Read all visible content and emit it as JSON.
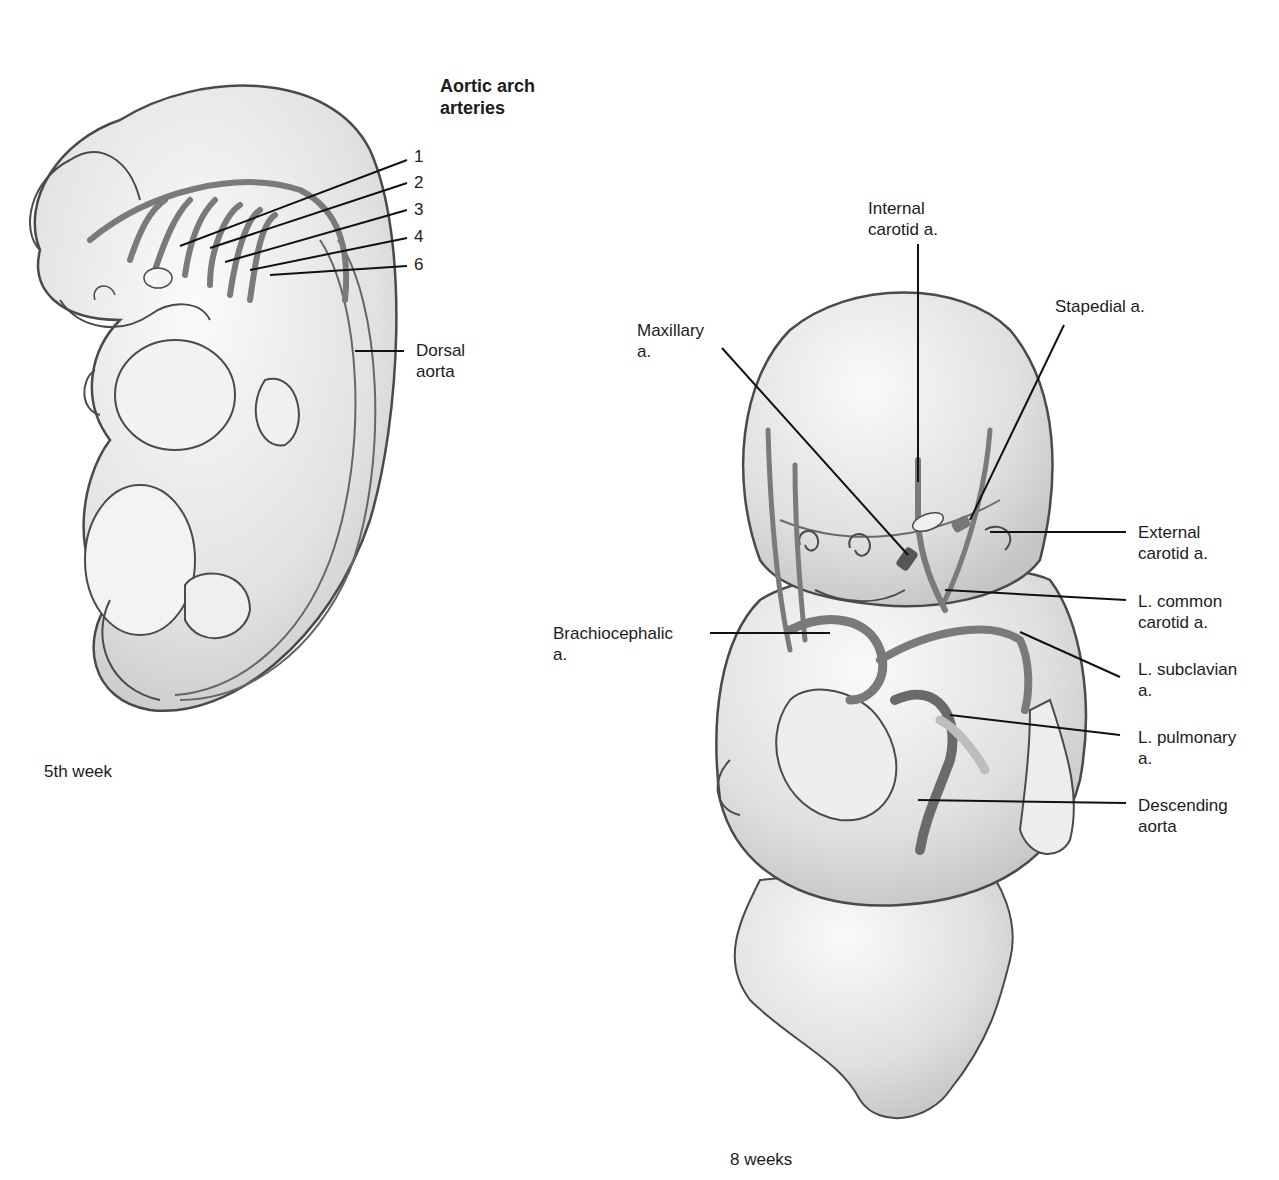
{
  "panel_5th_week": {
    "caption": "5th week",
    "heading": "Aortic arch\narteries",
    "arch_numbers": [
      "1",
      "2",
      "3",
      "4",
      "6"
    ],
    "dorsal_aorta": "Dorsal\naorta"
  },
  "panel_8_weeks": {
    "caption": "8 weeks",
    "labels": {
      "internal_carotid": "Internal\ncarotid a.",
      "stapedial": "Stapedial a.",
      "maxillary": "Maxillary\na.",
      "external_carotid": "External\ncarotid a.",
      "l_common_carotid": "L. common\ncarotid a.",
      "brachiocephalic": "Brachiocephalic\na.",
      "l_subclavian": "L. subclavian\na.",
      "l_pulmonary": "L. pulmonary\na.",
      "descending_aorta": "Descending\naorta"
    }
  },
  "colors": {
    "outline": "#4a4a4a",
    "skin_fill": "#e6e6e6",
    "artery": "#7a7a7a",
    "artery_dark": "#555555",
    "leader": "#111111"
  }
}
